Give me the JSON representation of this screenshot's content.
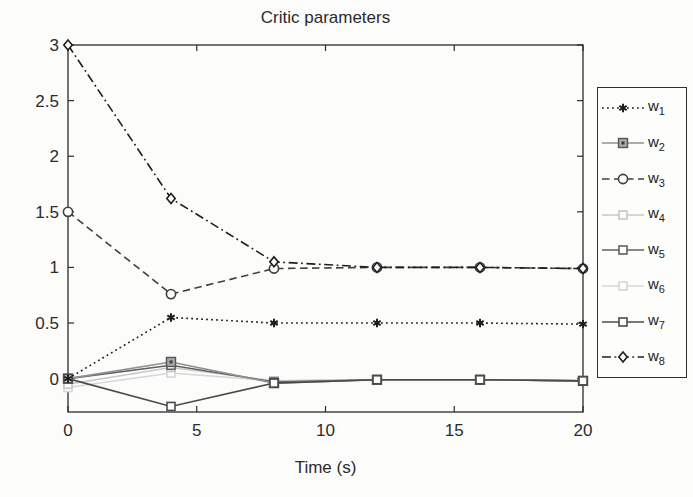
{
  "figure": {
    "background": "#fcfcfb",
    "axis_color": "#2b2b2b",
    "text_color": "#2b2b2b"
  },
  "chart_data": {
    "type": "line",
    "title": "Critic parameters",
    "xlabel": "Time (s)",
    "ylabel": "",
    "xlim": [
      0,
      20
    ],
    "ylim": [
      -0.3,
      3
    ],
    "xticks": [
      "0",
      "5",
      "10",
      "15",
      "20"
    ],
    "yticks": [
      "0",
      "0.5",
      "1",
      "1.5",
      "2",
      "2.5",
      "3"
    ],
    "grid": false,
    "legend_position": "outside-right",
    "x": [
      0,
      4,
      8,
      12,
      16,
      20
    ],
    "series": [
      {
        "name": "w1",
        "label_base": "w",
        "label_sub": "1",
        "values": [
          0,
          0.55,
          0.5,
          0.5,
          0.5,
          0.49
        ],
        "color": "#1f1f1f",
        "linestyle": "dotted",
        "marker": "asterisk"
      },
      {
        "name": "w2",
        "label_base": "w",
        "label_sub": "2",
        "values": [
          0,
          0.15,
          -0.04,
          -0.01,
          -0.01,
          -0.02
        ],
        "color": "#909090",
        "linestyle": "solid",
        "marker": "filled-square"
      },
      {
        "name": "w3",
        "label_base": "w",
        "label_sub": "3",
        "values": [
          1.5,
          0.76,
          0.99,
          1.0,
          1.0,
          0.99
        ],
        "color": "#3f3f3f",
        "linestyle": "dashed",
        "marker": "circle"
      },
      {
        "name": "w4",
        "label_base": "w",
        "label_sub": "4",
        "values": [
          -0.05,
          0.1,
          -0.02,
          -0.01,
          -0.01,
          -0.02
        ],
        "color": "#c7c7c7",
        "linestyle": "solid",
        "marker": "square"
      },
      {
        "name": "w5",
        "label_base": "w",
        "label_sub": "5",
        "values": [
          0,
          0.12,
          -0.03,
          -0.01,
          -0.01,
          -0.02
        ],
        "color": "#616161",
        "linestyle": "solid",
        "marker": "square"
      },
      {
        "name": "w6",
        "label_base": "w",
        "label_sub": "6",
        "values": [
          -0.08,
          0.05,
          -0.02,
          -0.01,
          -0.01,
          -0.02
        ],
        "color": "#d6d6d6",
        "linestyle": "solid",
        "marker": "square"
      },
      {
        "name": "w7",
        "label_base": "w",
        "label_sub": "7",
        "values": [
          0,
          -0.25,
          -0.04,
          -0.01,
          -0.01,
          -0.02
        ],
        "color": "#4b4b4b",
        "linestyle": "solid",
        "marker": "square"
      },
      {
        "name": "w8",
        "label_base": "w",
        "label_sub": "8",
        "values": [
          3,
          1.62,
          1.05,
          1.0,
          1.0,
          0.99
        ],
        "color": "#1f1f1f",
        "linestyle": "dashdot",
        "marker": "diamond"
      }
    ],
    "draw_order": [
      "w6",
      "w4",
      "w5",
      "w2",
      "w7",
      "w1",
      "w3",
      "w8"
    ]
  }
}
